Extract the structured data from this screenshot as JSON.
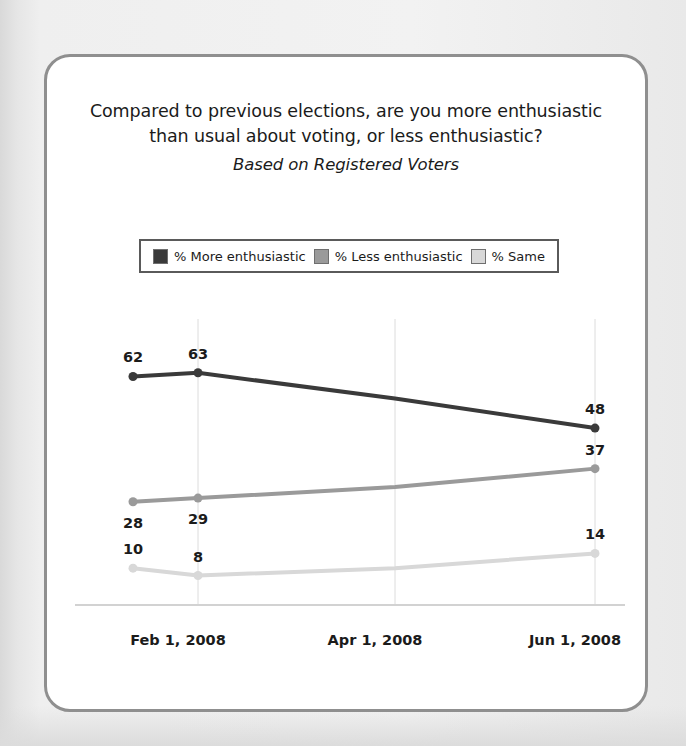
{
  "card": {
    "title_line_1": "Compared to previous elections, are you more enthusiastic",
    "title_line_2": "than usual about voting, or less enthusiastic?",
    "subtitle": "Based on Registered Voters"
  },
  "legend": {
    "items": [
      {
        "label": "% More enthusiastic",
        "color": "#3a3a3a"
      },
      {
        "label": "% Less enthusiastic",
        "color": "#9a9a9a"
      },
      {
        "label": "% Same",
        "color": "#d8d8d8"
      }
    ]
  },
  "axis": {
    "ticks": [
      "Feb 1, 2008",
      "Apr 1, 2008",
      "Jun 1, 2008"
    ]
  },
  "chart_data": {
    "type": "line",
    "title": "Compared to previous elections, are you more enthusiastic than usual about voting, or less enthusiastic?",
    "subtitle": "Based on Registered Voters",
    "xlabel": "",
    "ylabel": "",
    "ylim": [
      0,
      70
    ],
    "grid": "vertical",
    "legend_position": "top",
    "x": [
      "Jan 2008",
      "Feb 1, 2008",
      "Apr 1, 2008",
      "Jun 1, 2008"
    ],
    "tick_labels": [
      "Feb 1, 2008",
      "Apr 1, 2008",
      "Jun 1, 2008"
    ],
    "series": [
      {
        "name": "% More enthusiastic",
        "color": "#3a3a3a",
        "values": [
          62,
          63,
          56,
          48
        ],
        "labeled_points": [
          {
            "x": "Jan 2008",
            "value": 62,
            "label": "62",
            "label_position": "above"
          },
          {
            "x": "Feb 1, 2008",
            "value": 63,
            "label": "63",
            "label_position": "above"
          },
          {
            "x": "Jun 1, 2008",
            "value": 48,
            "label": "48",
            "label_position": "above"
          }
        ]
      },
      {
        "name": "% Less enthusiastic",
        "color": "#9a9a9a",
        "values": [
          28,
          29,
          32,
          37
        ],
        "labeled_points": [
          {
            "x": "Jan 2008",
            "value": 28,
            "label": "28",
            "label_position": "below"
          },
          {
            "x": "Feb 1, 2008",
            "value": 29,
            "label": "29",
            "label_position": "below"
          },
          {
            "x": "Jun 1, 2008",
            "value": 37,
            "label": "37",
            "label_position": "above"
          }
        ]
      },
      {
        "name": "% Same",
        "color": "#d8d8d8",
        "values": [
          10,
          8,
          10,
          14
        ],
        "labeled_points": [
          {
            "x": "Jan 2008",
            "value": 10,
            "label": "10",
            "label_position": "above"
          },
          {
            "x": "Feb 1, 2008",
            "value": 8,
            "label": "8",
            "label_position": "above"
          },
          {
            "x": "Jun 1, 2008",
            "value": 14,
            "label": "14",
            "label_position": "above"
          }
        ]
      }
    ]
  }
}
